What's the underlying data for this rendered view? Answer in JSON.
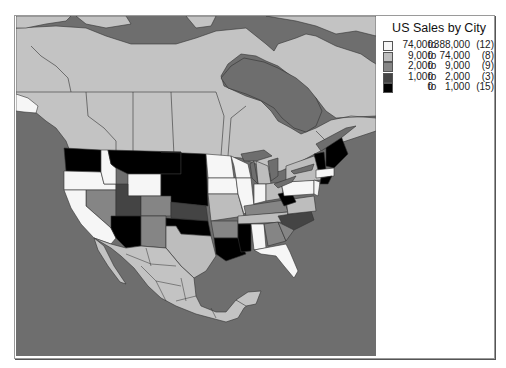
{
  "legend": {
    "title": "US Sales by City",
    "rows": [
      {
        "low": "74,000",
        "to": "to",
        "high": "388,000",
        "count": "(12)",
        "color": "#f6f6f6"
      },
      {
        "low": "9,000",
        "to": "to",
        "high": "74,000",
        "count": "(8)",
        "color": "#bdbdbd"
      },
      {
        "low": "2,000",
        "to": "to",
        "high": "9,000",
        "count": "(9)",
        "color": "#858585"
      },
      {
        "low": "1,000",
        "to": "to",
        "high": "2,000",
        "count": "(3)",
        "color": "#444444"
      },
      {
        "low": "0",
        "to": "to",
        "high": "1,000",
        "count": "(15)",
        "color": "#000000"
      }
    ]
  },
  "map": {
    "water_color": "#6e6e6e",
    "land_color": "#c3c3c3",
    "border_color": "#333333"
  }
}
